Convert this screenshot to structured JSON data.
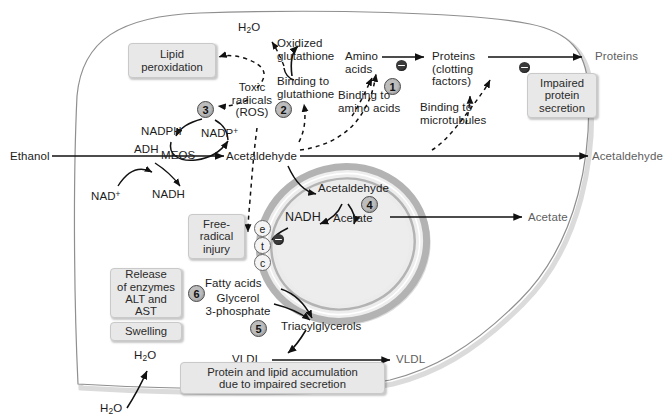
{
  "figure": {
    "cell_label": "hepatocyte",
    "organelle_label": "mitochondrion"
  },
  "colors": {
    "box_fill": "#e8e8e8",
    "box_border": "#c9c9c9",
    "step_fill": "#bdbdbd",
    "membrane": "#b0b0b0",
    "mito_matrix": "#ebebeb",
    "text": "#1c1c1c",
    "external_text": "#5e5e5e"
  },
  "pathway": {
    "substrate_in": "Ethanol",
    "enzyme_adh": "ADH",
    "enzyme_meos": "MEOS",
    "cofactor_nad": "NAD",
    "cofactor_nad_sup": "+",
    "cofactor_nadh": "NADH",
    "cofactor_nadph": "NADPH",
    "cofactor_nadp": "NADP",
    "cofactor_nadp_sup": "+",
    "acetaldehyde": "Acetaldehyde",
    "acetaldehyde_mito": "Acetaldehyde",
    "nadh_mito": "NADH",
    "acetate": "Acetate",
    "acetate_out": "Acetate",
    "acetaldehyde_out": "Acetaldehyde"
  },
  "radicals": {
    "toxic_radicals_l1": "Toxic",
    "toxic_radicals_l2": "radicals",
    "toxic_radicals_l3": "(ROS)",
    "water": "H",
    "water_sub": "2",
    "water_tail": "O",
    "oxidized_glutathione_l1": "Oxidized",
    "oxidized_glutathione_l2": "glutathione",
    "binding_glutathione_l1": "Binding to",
    "binding_glutathione_l2": "glutathione"
  },
  "proteins": {
    "amino_acids_l1": "Amino",
    "amino_acids_l2": "acids",
    "proteins_l1": "Proteins",
    "proteins_l2": "(clotting",
    "proteins_l3": "factors)",
    "proteins_out": "Proteins",
    "binding_amino_l1": "Binding to",
    "binding_amino_l2": "amino acids",
    "binding_micro_l1": "Binding to",
    "binding_micro_l2": "microtubules"
  },
  "lipids": {
    "fatty_acids": "Fatty acids",
    "glycerol_l1": "Glycerol",
    "glycerol_l2": "3-phosphate",
    "triacylglycerols": "Triacylglycerols",
    "vldl": "VLDL",
    "vldl_out": "VLDL"
  },
  "water_flux": {
    "inner": "H",
    "inner_sub": "2",
    "inner_tail": "O",
    "outer": "H",
    "outer_sub": "2",
    "outer_tail": "O"
  },
  "boxes": {
    "lipid_peroxidation": "Lipid\nperoxidation",
    "impaired_protein_secretion": "Impaired\nprotein\nsecretion",
    "free_radical_injury": "Free-\nradical\ninjury",
    "release_of_enzymes": "Release\nof enzymes\nALT and\nAST",
    "swelling": "Swelling",
    "protein_lipid_accumulation": "Protein and lipid accumulation\ndue to impaired secretion"
  },
  "steps": [
    {
      "id": "step-1",
      "number": "1",
      "describes": "Binding to amino acids"
    },
    {
      "id": "step-2",
      "number": "2",
      "describes": "Binding to glutathione"
    },
    {
      "id": "step-3",
      "number": "3",
      "describes": "MEOS / NADPH oxidation"
    },
    {
      "id": "step-4",
      "number": "4",
      "describes": "Acetaldehyde to acetate"
    },
    {
      "id": "step-5",
      "number": "5",
      "describes": "Triacylglycerol synthesis"
    },
    {
      "id": "step-6",
      "number": "6",
      "describes": "Release of enzymes ALT and AST"
    }
  ],
  "etc_chain": [
    {
      "id": "etc-e",
      "label": "e"
    },
    {
      "id": "etc-t",
      "label": "t"
    },
    {
      "id": "etc-c",
      "label": "c"
    }
  ]
}
